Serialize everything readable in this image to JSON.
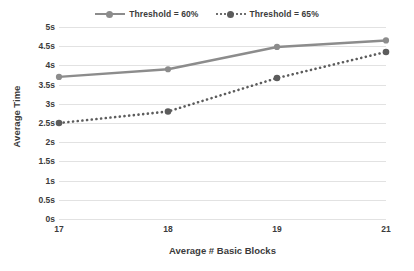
{
  "chart_data": {
    "type": "line",
    "title": "",
    "xlabel": "Average # Basic Blocks",
    "ylabel": "Average Time",
    "categories": [
      "17",
      "18",
      "19",
      "21"
    ],
    "series": [
      {
        "name": "Threshold = 60%",
        "values": [
          3.7,
          3.9,
          4.48,
          4.65
        ],
        "style": "solid",
        "color": "#8c8c8c",
        "marker": "circle"
      },
      {
        "name": "Threshold = 65%",
        "values": [
          2.5,
          2.8,
          3.67,
          4.35
        ],
        "style": "dotted",
        "color": "#5c5c5c",
        "marker": "circle"
      }
    ],
    "ylim": [
      0,
      5
    ],
    "ytick_step": 0.5,
    "ytick_labels": [
      "5s",
      "4.5s",
      "4s",
      "3.5s",
      "3s",
      "2.5s",
      "2s",
      "1.5s",
      "1s",
      "0.5s",
      "0s"
    ],
    "ytick_values": [
      5,
      4.5,
      4,
      3.5,
      3,
      2.5,
      2,
      1.5,
      1,
      0.5,
      0
    ],
    "grid": true,
    "grid_color": "#e2e2e2",
    "legend_position": "top",
    "background": "#ffffff"
  },
  "legend": {
    "entries": [
      {
        "label": "Threshold = 60%",
        "key": "solid-line-marker-icon"
      },
      {
        "label": "Threshold = 65%",
        "key": "dotted-line-marker-icon"
      }
    ]
  },
  "axes": {
    "x_title": "Average # Basic Blocks",
    "y_title": "Average Time"
  }
}
